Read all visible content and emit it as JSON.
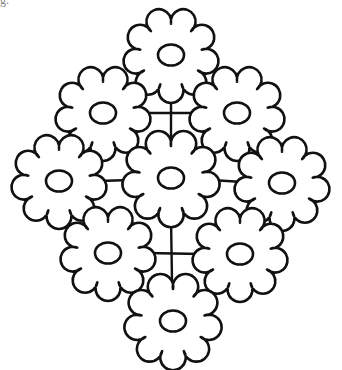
{
  "figure": {
    "caption_fragment": "g.",
    "stroke_color": "#111111",
    "background": "#ffffff",
    "flowers": [
      {
        "id": "top",
        "cx": 171,
        "cy": 55,
        "r": 39
      },
      {
        "id": "upper-left",
        "cx": 103,
        "cy": 113,
        "r": 39
      },
      {
        "id": "upper-right",
        "cx": 237,
        "cy": 113,
        "r": 39
      },
      {
        "id": "middle-left",
        "cx": 59,
        "cy": 181,
        "r": 39
      },
      {
        "id": "center",
        "cx": 171,
        "cy": 178,
        "r": 40
      },
      {
        "id": "middle-right",
        "cx": 282,
        "cy": 183,
        "r": 39
      },
      {
        "id": "lower-left",
        "cx": 108,
        "cy": 253,
        "r": 39
      },
      {
        "id": "lower-right",
        "cx": 240,
        "cy": 254,
        "r": 39
      },
      {
        "id": "bottom",
        "cx": 173,
        "cy": 321,
        "r": 40
      }
    ],
    "stems": [
      {
        "x1": 171,
        "y1": 94,
        "x2": 171,
        "y2": 139
      },
      {
        "x1": 142,
        "y1": 113,
        "x2": 198,
        "y2": 113
      },
      {
        "x1": 98,
        "y1": 181,
        "x2": 131,
        "y2": 180
      },
      {
        "x1": 211,
        "y1": 180,
        "x2": 243,
        "y2": 182
      },
      {
        "x1": 171,
        "y1": 218,
        "x2": 172,
        "y2": 281
      },
      {
        "x1": 147,
        "y1": 253,
        "x2": 201,
        "y2": 254
      }
    ]
  }
}
